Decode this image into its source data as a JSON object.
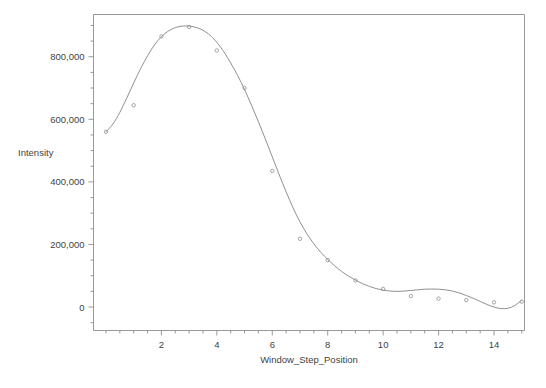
{
  "chart_data": {
    "type": "scatter",
    "title": "",
    "xlabel": "Window_Step_Position",
    "ylabel": "Intensity",
    "xlim": [
      -0.45,
      15.1
    ],
    "ylim": [
      -75000,
      935000
    ],
    "grid": false,
    "legend": false,
    "x": [
      0,
      1,
      2,
      3,
      4,
      5,
      6,
      7,
      8,
      9,
      10,
      11,
      12,
      13,
      14,
      15
    ],
    "values": [
      560000,
      645000,
      865000,
      895000,
      820000,
      700000,
      435000,
      218000,
      150000,
      85000,
      58000,
      35000,
      27000,
      22000,
      15000,
      17000
    ],
    "series": [
      {
        "name": "Intensity",
        "marker": "open-circle",
        "values": [
          560000,
          645000,
          865000,
          895000,
          820000,
          700000,
          435000,
          218000,
          150000,
          85000,
          58000,
          35000,
          27000,
          22000,
          15000,
          17000
        ]
      },
      {
        "name": "smoothing-fit",
        "type": "line",
        "x": [
          0.0,
          0.25,
          0.5,
          0.75,
          1.0,
          1.25,
          1.5,
          1.75,
          2.0,
          2.25,
          2.5,
          2.75,
          3.0,
          3.2,
          3.4,
          3.6,
          3.8,
          4.0,
          4.25,
          4.5,
          4.75,
          5.0,
          5.25,
          5.5,
          5.75,
          6.0,
          6.25,
          6.5,
          6.75,
          7.0,
          7.25,
          7.5,
          7.75,
          8.0,
          8.25,
          8.5,
          8.75,
          9.0,
          9.25,
          9.5,
          9.75,
          10.0,
          10.25,
          10.5,
          10.75,
          11.0,
          11.25,
          11.5,
          11.75,
          12.0,
          12.25,
          12.5,
          12.75,
          13.0,
          13.25,
          13.5,
          13.75,
          14.0,
          14.25,
          14.5,
          14.75,
          15.0
        ],
        "values": [
          560000,
          585000,
          622000,
          668000,
          716000,
          762000,
          803000,
          838000,
          864000,
          882000,
          893000,
          898000,
          898000,
          895000,
          889000,
          879000,
          865000,
          846000,
          816000,
          780000,
          740000,
          695000,
          645000,
          592000,
          537000,
          480000,
          423000,
          368000,
          317000,
          272000,
          234000,
          202000,
          175000,
          152000,
          132000,
          114000,
          99000,
          86000,
          75000,
          66000,
          59000,
          54000,
          51000,
          50000,
          51000,
          53000,
          55000,
          57000,
          57500,
          57000,
          55000,
          51000,
          45000,
          37000,
          28000,
          18000,
          8000,
          0,
          -5000,
          -4000,
          5000,
          22000
        ]
      }
    ],
    "y_ticks": [
      {
        "value": 0,
        "label": "0"
      },
      {
        "value": 200000,
        "label": "200,000"
      },
      {
        "value": 400000,
        "label": "400,000"
      },
      {
        "value": 600000,
        "label": "600,000"
      },
      {
        "value": 800000,
        "label": "800,000"
      }
    ],
    "y_minor_step": 50000,
    "x_ticks": [
      {
        "value": 2,
        "label": "2"
      },
      {
        "value": 4,
        "label": "4"
      },
      {
        "value": 6,
        "label": "6"
      },
      {
        "value": 8,
        "label": "8"
      },
      {
        "value": 10,
        "label": "10"
      },
      {
        "value": 12,
        "label": "12"
      },
      {
        "value": 14,
        "label": "14"
      }
    ],
    "x_minor_step": 0.5,
    "colors": {
      "axis": "#8d8d8d",
      "curve": "#8a8a8a",
      "marker": "#8f8f8f",
      "text": "#3f3f3f",
      "background": "#ffffff"
    }
  }
}
